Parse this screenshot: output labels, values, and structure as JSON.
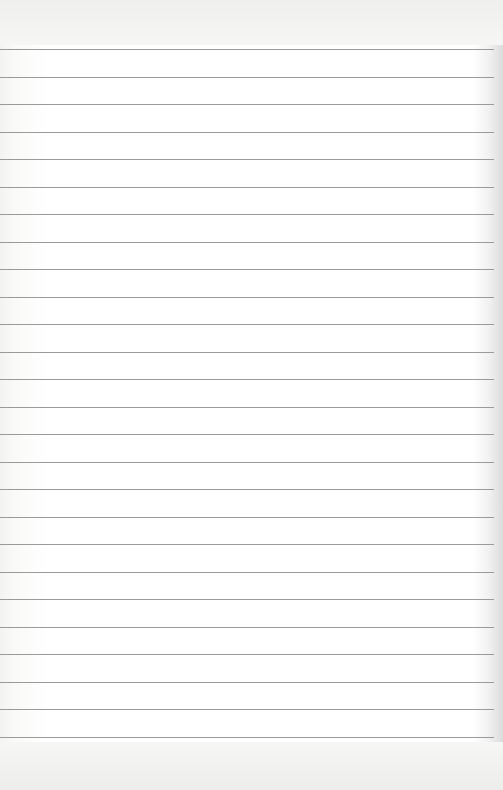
{
  "paper": {
    "type": "lined-notebook-page",
    "line_count": 26,
    "first_line_y": 49,
    "line_spacing": 27.5,
    "line_color": "#9a9a9a",
    "background_color": "#ffffff"
  }
}
